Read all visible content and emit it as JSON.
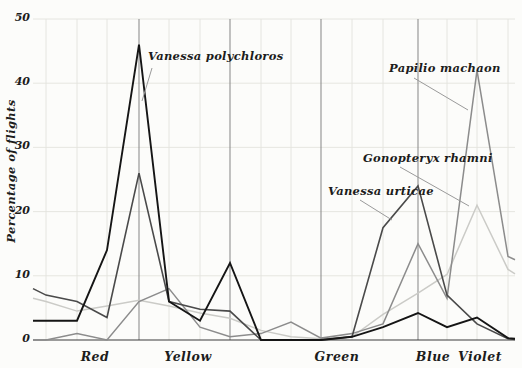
{
  "chart_data": {
    "type": "line",
    "title": "",
    "ylabel": "Percentage of flights",
    "ylim": [
      0,
      50
    ],
    "yticks": [
      0,
      10,
      20,
      30,
      40,
      50
    ],
    "grid": true,
    "legend_position": "annotations-on-plot",
    "x_px": [
      33,
      46,
      77,
      107,
      139,
      169,
      200,
      230,
      261,
      291,
      321,
      352,
      383,
      418,
      447,
      477,
      508,
      515
    ],
    "x_color_bands": [
      {
        "label": "Red",
        "x": 95
      },
      {
        "label": "Yellow",
        "x": 188
      },
      {
        "label": "Green",
        "x": 337
      },
      {
        "label": "Blue",
        "x": 433
      },
      {
        "label": "Violet",
        "x": 480
      }
    ],
    "series": [
      {
        "name": "Vanessa polychloros",
        "color": "#151515",
        "width": 1.9,
        "values": [
          3,
          3,
          3,
          14,
          46,
          6,
          3,
          12,
          0,
          0,
          0,
          0.5,
          2,
          4.2,
          2,
          3.5,
          0.3,
          0.2
        ]
      },
      {
        "name": "Vanessa urticae",
        "color": "#4a4a4a",
        "width": 1.6,
        "values": [
          8,
          7,
          6,
          3.5,
          26,
          6,
          4.8,
          4.5,
          0,
          0,
          0,
          0.5,
          17.5,
          24,
          7,
          2.5,
          0.2,
          0.1
        ]
      },
      {
        "name": "Papilio machaon",
        "color": "#8c8c8c",
        "width": 1.5,
        "values": [
          0,
          0,
          1,
          0,
          6,
          8,
          2,
          0.5,
          1,
          2.8,
          0.3,
          1,
          2.5,
          15,
          6.5,
          42,
          13,
          12.5
        ]
      },
      {
        "name": "Gonopteryx rhamni",
        "color": "#cbcbc7",
        "width": 1.5,
        "values": [
          6.5,
          6,
          4.5,
          5.3,
          6.2,
          5.3,
          4.2,
          3.4,
          1.5,
          0.5,
          0.2,
          0.5,
          4,
          7.3,
          10.2,
          21,
          11,
          10.3
        ]
      }
    ],
    "annotations": [
      {
        "text": "Vanessa polychloros",
        "x": 148,
        "y": 49,
        "pointer": {
          "x1": 152,
          "y1": 68,
          "x2": 142,
          "y2": 101
        }
      },
      {
        "text": "Papilio machaon",
        "x": 389,
        "y": 61,
        "pointer": {
          "x1": 414,
          "y1": 78,
          "x2": 468,
          "y2": 110
        }
      },
      {
        "text": "Gonopteryx rhamni",
        "x": 363,
        "y": 151,
        "pointer": {
          "x1": 400,
          "y1": 167,
          "x2": 469,
          "y2": 206
        }
      },
      {
        "text": "Vanessa urticae",
        "x": 328,
        "y": 184,
        "pointer": {
          "x1": 360,
          "y1": 200,
          "x2": 392,
          "y2": 220
        }
      }
    ],
    "layout": {
      "plot_left": 33,
      "plot_right": 515,
      "y_zero_px": 340,
      "px_per_unit": 6.42,
      "grid_x_light": [
        46,
        77,
        107,
        169,
        200,
        261,
        291,
        352,
        383,
        447,
        477,
        508
      ],
      "grid_x_dark": [
        139,
        230,
        321,
        418
      ],
      "grid_color_light": "#e3e3de",
      "grid_color_dark": "#858585",
      "axis_color": "#3a3a3a",
      "pointer_color": "#9a9a9a",
      "background": "#fcfcfa"
    }
  }
}
